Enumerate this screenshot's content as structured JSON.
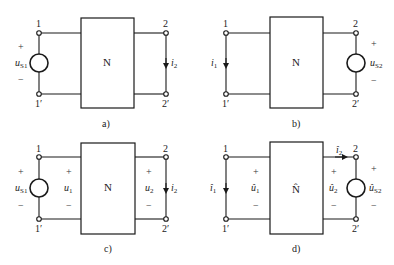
{
  "figures": [
    {
      "id": "a",
      "caption": "a)",
      "network_label": "N",
      "terminals": {
        "t1": "1",
        "t1p": "1′",
        "t2": "2",
        "t2p": "2′"
      },
      "left_source": {
        "name": "u",
        "sub": "S1",
        "plus": "+",
        "minus": "−"
      },
      "right_current": {
        "name": "i",
        "sub": "2"
      }
    },
    {
      "id": "b",
      "caption": "b)",
      "network_label": "N",
      "terminals": {
        "t1": "1",
        "t1p": "1′",
        "t2": "2",
        "t2p": "2′"
      },
      "left_current": {
        "name": "i",
        "sub": "1"
      },
      "right_source": {
        "name": "u",
        "sub": "S2",
        "plus": "+",
        "minus": "−"
      }
    },
    {
      "id": "c",
      "caption": "c)",
      "network_label": "N",
      "terminals": {
        "t1": "1",
        "t1p": "1′",
        "t2": "2",
        "t2p": "2′"
      },
      "left_source": {
        "name": "u",
        "sub": "S1",
        "plus": "+",
        "minus": "−"
      },
      "port1_voltage": {
        "name": "u",
        "sub": "1",
        "plus": "+",
        "minus": "−"
      },
      "port2_voltage": {
        "name": "u",
        "sub": "2",
        "plus": "+",
        "minus": "−"
      },
      "right_current": {
        "name": "i",
        "sub": "2"
      }
    },
    {
      "id": "d",
      "caption": "d)",
      "network_label": "N̂",
      "terminals": {
        "t1": "1",
        "t1p": "1′",
        "t2": "2",
        "t2p": "2′"
      },
      "left_current": {
        "name": "î",
        "sub": "1"
      },
      "port1_voltage": {
        "name": "û",
        "sub": "1",
        "plus": "+",
        "minus": "−"
      },
      "top_current": {
        "name": "î",
        "sub": "2"
      },
      "port2_voltage": {
        "name": "û",
        "sub": "2",
        "plus": "+",
        "minus": "−"
      },
      "right_source": {
        "name": "û",
        "sub": "S2",
        "plus": "+",
        "minus": "−"
      }
    }
  ]
}
